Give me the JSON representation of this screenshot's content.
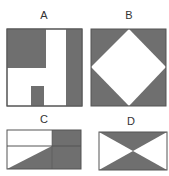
{
  "colors": {
    "fill": "#6f6f6f",
    "stroke": "#555555",
    "background": "#ffffff"
  },
  "panels": [
    {
      "label": "A",
      "description": "Square with dark top-left block, dark right strip, and small dark bottom block"
    },
    {
      "label": "B",
      "description": "Square with dark corners and a white diamond in the center"
    },
    {
      "label": "C",
      "description": "Rectangle with dark right section, horizontal divider, and dark lower-left triangle"
    },
    {
      "label": "D",
      "description": "Rectangle with dark top and bottom triangles forming an hourglass"
    }
  ]
}
